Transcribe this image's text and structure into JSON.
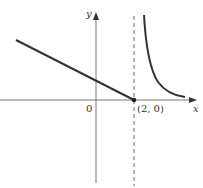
{
  "diagram": {
    "type": "function-graph",
    "labels": {
      "x_axis": "x",
      "y_axis": "y",
      "origin": "0",
      "point": "(2, 0)"
    },
    "elements": {
      "x_axis": {
        "from": [
          0,
          100
        ],
        "to": [
          196,
          100
        ]
      },
      "y_axis": {
        "from": [
          96,
          183
        ],
        "to": [
          96,
          12
        ]
      },
      "vertical_asymptote": {
        "x_value": 2,
        "style": "dashed"
      },
      "line_segment": {
        "from": [
          16,
          40
        ],
        "to": [
          134,
          100
        ],
        "description": "decreasing line ending at (2, 0)"
      },
      "curve": {
        "description": "hyperbola-like branch right of x = 2, descending toward x-axis"
      },
      "marked_point": {
        "coords": "(2, 0)",
        "style": "filled dot"
      }
    },
    "colors": {
      "stroke": "#333333",
      "axis": "#555555",
      "background": "#ffffff"
    }
  }
}
